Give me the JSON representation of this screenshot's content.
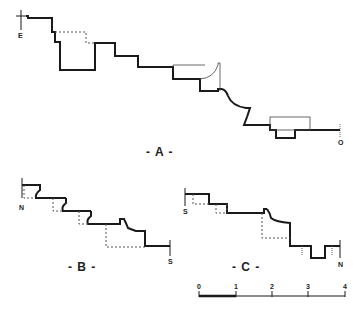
{
  "figures": {
    "a": {
      "caption": "- A -",
      "start_label": "E",
      "end_label": "O"
    },
    "b": {
      "caption": "- B -",
      "start_label": "N",
      "end_label": "S"
    },
    "c": {
      "caption": "- C -",
      "start_label": "S",
      "end_label": "N"
    }
  },
  "scale_bar": {
    "ticks": [
      "0",
      "1",
      "2",
      "3",
      "4"
    ]
  },
  "colors": {
    "line": "#1a1a1a",
    "dashed": "#555555",
    "background": "#ffffff"
  }
}
